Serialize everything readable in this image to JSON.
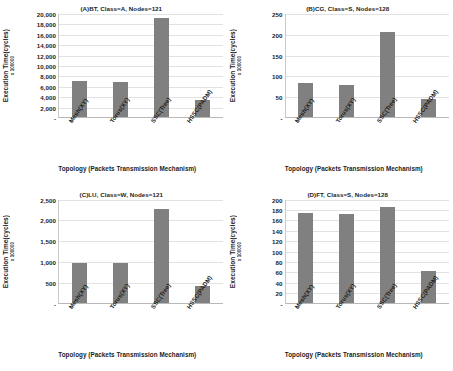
{
  "figure": {
    "axis_label_y": "Execution Time(cycles)",
    "axis_multiplier": "x 100000",
    "axis_label_x": "Topology (Packets Transmission Mechanism)",
    "zero_tick": "-",
    "bar_color": "#808080",
    "gridline_color": "#e2e2e2",
    "caption_partial": ""
  },
  "chart_data": [
    {
      "type": "bar",
      "panel": "A",
      "title": "(A)BT, Class=A, Nodes=121",
      "categories": [
        "Mesh(XY)",
        "Torus(XY)",
        "SSC(Tree)",
        "HSSC(PADM)"
      ],
      "values": [
        6900,
        6700,
        19000,
        3300
      ],
      "xlabel": "Topology (Packets Transmission Mechanism)",
      "ylabel": "Execution Time(cycles)",
      "y_multiplier": "x 100000",
      "ylim": [
        0,
        20000
      ],
      "yticks": [
        20000,
        18000,
        16000,
        14000,
        12000,
        10000,
        8000,
        6000,
        4000,
        2000
      ],
      "ytick_labels": [
        "20,000",
        "18,000",
        "16,000",
        "14,000",
        "12,000",
        "10,000",
        "8,000",
        "6,000",
        "4,000",
        "2,000"
      ],
      "grid": true,
      "legend": "none"
    },
    {
      "type": "bar",
      "panel": "B",
      "title": "(B)CG, Class=S, Nodes=128",
      "categories": [
        "Mesh(XY)",
        "Torus(XY)",
        "SSC(Tree)",
        "HSSC(PADM)"
      ],
      "values": [
        82,
        77,
        205,
        43
      ],
      "xlabel": "Topology (Packets Transmission Mechanism)",
      "ylabel": "Execution Time(cycles)",
      "y_multiplier": "x 100000",
      "ylim": [
        0,
        250
      ],
      "yticks": [
        250,
        200,
        150,
        100,
        50
      ],
      "ytick_labels": [
        "250",
        "200",
        "150",
        "100",
        "50"
      ],
      "grid": true,
      "legend": "none"
    },
    {
      "type": "bar",
      "panel": "C",
      "title": "(C)LU, Class=W, Nodes=121",
      "categories": [
        "Mesh(XY)",
        "Torus(XY)",
        "SSC(Tree)",
        "HSSC(PADM)"
      ],
      "values": [
        960,
        955,
        2250,
        400
      ],
      "xlabel": "Topology (Packets Transmission Mechanism)",
      "ylabel": "Execution Time(cycles)",
      "y_multiplier": "x 100000",
      "ylim": [
        0,
        2500
      ],
      "yticks": [
        2500,
        2000,
        1500,
        1000,
        500
      ],
      "ytick_labels": [
        "2,500",
        "2,000",
        "1,500",
        "1,000",
        "500"
      ],
      "grid": true,
      "legend": "none"
    },
    {
      "type": "bar",
      "panel": "D",
      "title": "(D)FT, Class=S, Nodes=128",
      "categories": [
        "Mesh(XY)",
        "Torus(XY)",
        "SSC(Tree)",
        "HSSC(PADM)"
      ],
      "values": [
        172,
        170,
        183,
        60
      ],
      "xlabel": "Topology (Packets Transmission Mechanism)",
      "ylabel": "Execution Time(cycles)",
      "y_multiplier": "x 100000",
      "ylim": [
        0,
        200
      ],
      "yticks": [
        200,
        180,
        160,
        140,
        120,
        100,
        80,
        60,
        40,
        20
      ],
      "ytick_labels": [
        "200",
        "180",
        "160",
        "140",
        "120",
        "100",
        "80",
        "60",
        "40",
        "20"
      ],
      "grid": true,
      "legend": "none"
    }
  ]
}
